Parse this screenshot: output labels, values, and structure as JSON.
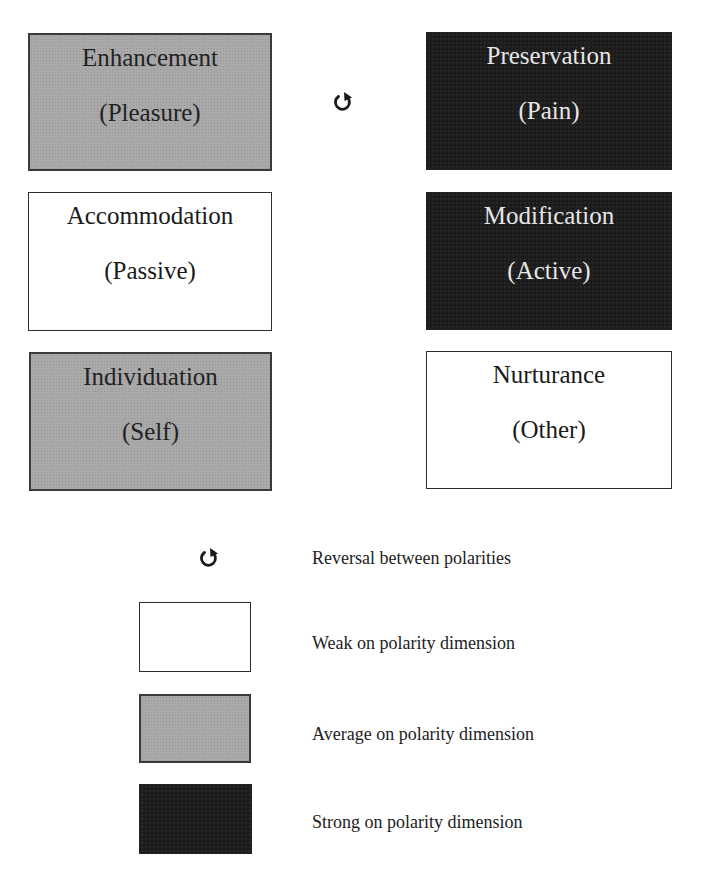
{
  "diagram": {
    "colors": {
      "weak": "#ffffff",
      "average": "#a9a9a9",
      "strong": "#1c1c1c",
      "border": "#2e2e2e"
    },
    "left_column": [
      {
        "title": "Enhancement",
        "subtitle": "(Pleasure)",
        "level": "average"
      },
      {
        "title": "Accommodation",
        "subtitle": "(Passive)",
        "level": "weak"
      },
      {
        "title": "Individuation",
        "subtitle": "(Self)",
        "level": "average"
      }
    ],
    "right_column": [
      {
        "title": "Preservation",
        "subtitle": "(Pain)",
        "level": "strong"
      },
      {
        "title": "Modification",
        "subtitle": "(Active)",
        "level": "strong"
      },
      {
        "title": "Nurturance",
        "subtitle": "(Other)",
        "level": "weak"
      }
    ],
    "reversal_marker": {
      "icon": "reversal-arrow-icon",
      "between": [
        "Enhancement",
        "Preservation"
      ]
    }
  },
  "legend": {
    "items": [
      {
        "icon": "reversal-arrow-icon",
        "label": "Reversal between polarities"
      },
      {
        "swatch": "weak",
        "label": "Weak on polarity dimension"
      },
      {
        "swatch": "average",
        "label": "Average on polarity dimension"
      },
      {
        "swatch": "strong",
        "label": "Strong on polarity dimension"
      }
    ]
  }
}
